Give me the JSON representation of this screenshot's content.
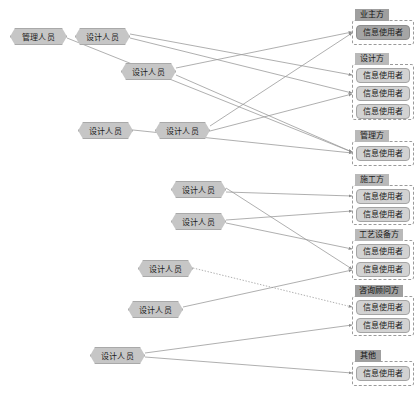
{
  "diagram": {
    "colors": {
      "actor_fill": "#c6c6c6",
      "actor_border": "#a9a9a9",
      "group_border": "#9a9a9a",
      "group_title_fill": "#b9b9b9",
      "group_title_accent": "#9f9f9f",
      "user_fill": "#d2d2d2",
      "user_accent": "#a5a5a5",
      "edge": "#9b9b9b",
      "background": "#ffffff"
    },
    "actors": [
      {
        "id": "a1",
        "label": "管理人员",
        "x": 10,
        "y": 28,
        "w": 57
      },
      {
        "id": "a2",
        "label": "设计人员",
        "x": 75,
        "y": 28,
        "w": 55
      },
      {
        "id": "a3",
        "label": "设计人员",
        "x": 121,
        "y": 63,
        "w": 55
      },
      {
        "id": "a4",
        "label": "设计人员",
        "x": 78,
        "y": 122,
        "w": 55
      },
      {
        "id": "a5",
        "label": "设计人员",
        "x": 155,
        "y": 122,
        "w": 55
      },
      {
        "id": "a6",
        "label": "设计人员",
        "x": 171,
        "y": 181,
        "w": 55
      },
      {
        "id": "a7",
        "label": "设计人员",
        "x": 171,
        "y": 213,
        "w": 55
      },
      {
        "id": "a8",
        "label": "设计人员",
        "x": 138,
        "y": 260,
        "w": 55
      },
      {
        "id": "a9",
        "label": "设计人员",
        "x": 128,
        "y": 301,
        "w": 55
      },
      {
        "id": "a10",
        "label": "设计人员",
        "x": 90,
        "y": 347,
        "w": 55
      }
    ],
    "groups": [
      {
        "id": "g1",
        "title": "业主方",
        "title_accent": true,
        "x": 352,
        "y": 20,
        "w": 62,
        "h": 25,
        "title_x": 355,
        "title_y": 9,
        "title_w": 34,
        "members": [
          {
            "id": "u1",
            "label": "信息使用者",
            "x": 356,
            "y": 25,
            "w": 54,
            "accent": true
          }
        ]
      },
      {
        "id": "g2",
        "title": "设计方",
        "title_accent": false,
        "x": 352,
        "y": 64,
        "w": 62,
        "h": 56,
        "title_x": 355,
        "title_y": 53,
        "title_w": 34,
        "members": [
          {
            "id": "u2",
            "label": "信息使用者",
            "x": 356,
            "y": 68,
            "w": 54,
            "accent": false
          },
          {
            "id": "u3",
            "label": "信息使用者",
            "x": 356,
            "y": 86,
            "w": 54,
            "accent": false
          },
          {
            "id": "u4",
            "label": "信息使用者",
            "x": 356,
            "y": 104,
            "w": 54,
            "accent": false
          }
        ]
      },
      {
        "id": "g3",
        "title": "管理方",
        "title_accent": false,
        "x": 352,
        "y": 141,
        "w": 62,
        "h": 25,
        "title_x": 355,
        "title_y": 130,
        "title_w": 34,
        "members": [
          {
            "id": "u5",
            "label": "信息使用者",
            "x": 356,
            "y": 146,
            "w": 54,
            "accent": false
          }
        ]
      },
      {
        "id": "g4",
        "title": "施工方",
        "title_accent": false,
        "x": 352,
        "y": 185,
        "w": 62,
        "h": 40,
        "title_x": 355,
        "title_y": 174,
        "title_w": 34,
        "members": [
          {
            "id": "u6",
            "label": "信息使用者",
            "x": 356,
            "y": 189,
            "w": 54,
            "accent": false
          },
          {
            "id": "u7",
            "label": "信息使用者",
            "x": 356,
            "y": 207,
            "w": 54,
            "accent": false
          }
        ]
      },
      {
        "id": "g5",
        "title": "工艺设备方",
        "title_accent": false,
        "x": 352,
        "y": 240,
        "w": 62,
        "h": 40,
        "title_x": 355,
        "title_y": 229,
        "title_w": 48,
        "members": [
          {
            "id": "u8",
            "label": "信息使用者",
            "x": 356,
            "y": 244,
            "w": 54,
            "accent": false
          },
          {
            "id": "u9",
            "label": "信息使用者",
            "x": 356,
            "y": 262,
            "w": 54,
            "accent": false
          }
        ]
      },
      {
        "id": "g6",
        "title": "咨询顾问方",
        "title_accent": true,
        "x": 352,
        "y": 296,
        "w": 62,
        "h": 40,
        "title_x": 355,
        "title_y": 285,
        "title_w": 48,
        "members": [
          {
            "id": "u10",
            "label": "信息使用者",
            "x": 356,
            "y": 300,
            "w": 54,
            "accent": false
          },
          {
            "id": "u11",
            "label": "信息使用者",
            "x": 356,
            "y": 318,
            "w": 54,
            "accent": false
          }
        ]
      },
      {
        "id": "g7",
        "title": "其他",
        "title_accent": true,
        "x": 352,
        "y": 361,
        "w": 62,
        "h": 25,
        "title_x": 355,
        "title_y": 350,
        "title_w": 26,
        "members": [
          {
            "id": "u12",
            "label": "信息使用者",
            "x": 356,
            "y": 366,
            "w": 54,
            "accent": false
          }
        ]
      }
    ],
    "edges": [
      {
        "id": "e1",
        "from": "a1",
        "to": "u5",
        "x1": 67,
        "y1": 38,
        "x2": 352,
        "y2": 152,
        "style": "solid",
        "arrow": true
      },
      {
        "id": "e2",
        "from": "a2",
        "to": "u2",
        "x1": 130,
        "y1": 34,
        "x2": 352,
        "y2": 75,
        "style": "solid",
        "arrow": true
      },
      {
        "id": "e3",
        "from": "a2",
        "to": "u3",
        "x1": 130,
        "y1": 38,
        "x2": 352,
        "y2": 93,
        "style": "solid",
        "arrow": true
      },
      {
        "id": "e4",
        "from": "a3",
        "to": "u1",
        "x1": 176,
        "y1": 68,
        "x2": 352,
        "y2": 32,
        "style": "solid",
        "arrow": true
      },
      {
        "id": "e5",
        "from": "a3",
        "to": "u5",
        "x1": 176,
        "y1": 75,
        "x2": 352,
        "y2": 152,
        "style": "solid",
        "arrow": true
      },
      {
        "id": "e6",
        "from": "a4",
        "to": "u5",
        "x1": 133,
        "y1": 130,
        "x2": 352,
        "y2": 153,
        "style": "solid",
        "arrow": true
      },
      {
        "id": "e7",
        "from": "a5",
        "to": "u1",
        "x1": 210,
        "y1": 126,
        "x2": 352,
        "y2": 33,
        "style": "solid",
        "arrow": true
      },
      {
        "id": "e8",
        "from": "a5",
        "to": "u3",
        "x1": 210,
        "y1": 131,
        "x2": 352,
        "y2": 94,
        "style": "solid",
        "arrow": true
      },
      {
        "id": "e9",
        "from": "a6",
        "to": "u9",
        "x1": 226,
        "y1": 188,
        "x2": 352,
        "y2": 269,
        "style": "solid",
        "arrow": true
      },
      {
        "id": "e10",
        "from": "a6",
        "to": "u6",
        "x1": 226,
        "y1": 192,
        "x2": 352,
        "y2": 196,
        "style": "solid",
        "arrow": true
      },
      {
        "id": "e11",
        "from": "a7",
        "to": "u7",
        "x1": 226,
        "y1": 220,
        "x2": 352,
        "y2": 211,
        "style": "solid",
        "arrow": true
      },
      {
        "id": "e12",
        "from": "a7",
        "to": "u8",
        "x1": 226,
        "y1": 223,
        "x2": 352,
        "y2": 249,
        "style": "solid",
        "arrow": true
      },
      {
        "id": "e13",
        "from": "a8",
        "to": "u10",
        "x1": 193,
        "y1": 268,
        "x2": 352,
        "y2": 307,
        "style": "dotted",
        "arrow": true
      },
      {
        "id": "e14",
        "from": "a9",
        "to": "u9",
        "x1": 183,
        "y1": 307,
        "x2": 352,
        "y2": 270,
        "style": "solid",
        "arrow": true
      },
      {
        "id": "e15",
        "from": "a10",
        "to": "u11",
        "x1": 145,
        "y1": 353,
        "x2": 352,
        "y2": 325,
        "style": "solid",
        "arrow": true
      },
      {
        "id": "e16",
        "from": "a10",
        "to": "u12",
        "x1": 145,
        "y1": 357,
        "x2": 352,
        "y2": 373,
        "style": "solid",
        "arrow": true
      }
    ]
  }
}
